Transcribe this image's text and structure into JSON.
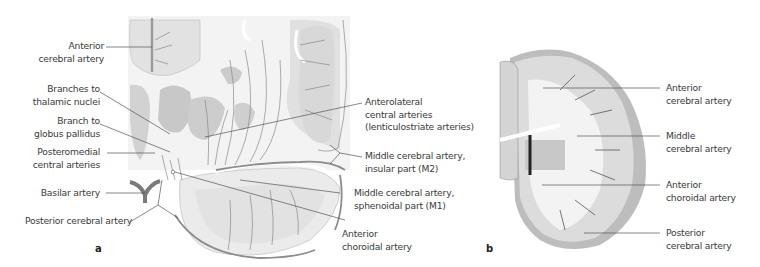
{
  "panel_a": {
    "letter": "a",
    "labels": {
      "anterior_cerebral_artery": [
        "Anterior",
        "cerebral artery"
      ],
      "branches_thalamic": [
        "Branches to",
        "thalamic nuclei"
      ],
      "branch_globus": [
        "Branch to",
        "globus pallidus"
      ],
      "posteromedial": [
        "Posteromedial",
        "central arteries"
      ],
      "basilar": [
        "Basilar artery"
      ],
      "posterior_cerebral": [
        "Posterior cerebral artery"
      ],
      "anterolateral": [
        "Anterolateral",
        "central arteries",
        "(lenticulostriate arteries)"
      ],
      "mca_m2": [
        "Middle cerebral artery,",
        "insular part (M2)"
      ],
      "mca_m1": [
        "Middle cerebral artery,",
        "sphenoidal part (M1)"
      ],
      "anterior_choroidal": [
        "Anterior",
        "choroidal artery"
      ]
    }
  },
  "panel_b": {
    "letter": "b",
    "labels": {
      "anterior_cerebral": [
        "Anterior",
        "cerebral artery"
      ],
      "middle_cerebral": [
        "Middle",
        "cerebral artery"
      ],
      "anterior_choroidal": [
        "Anterior",
        "choroidal artery"
      ],
      "posterior_cerebral": [
        "Posterior",
        "cerebral artery"
      ]
    }
  },
  "colors": {
    "text": "#3a3a3a",
    "leader": "#555555",
    "vessel": "#8a8a8a",
    "territory_dark": "#c4c4c4",
    "territory_light": "#e6e6e6",
    "cortex": "#d0d0d0"
  }
}
